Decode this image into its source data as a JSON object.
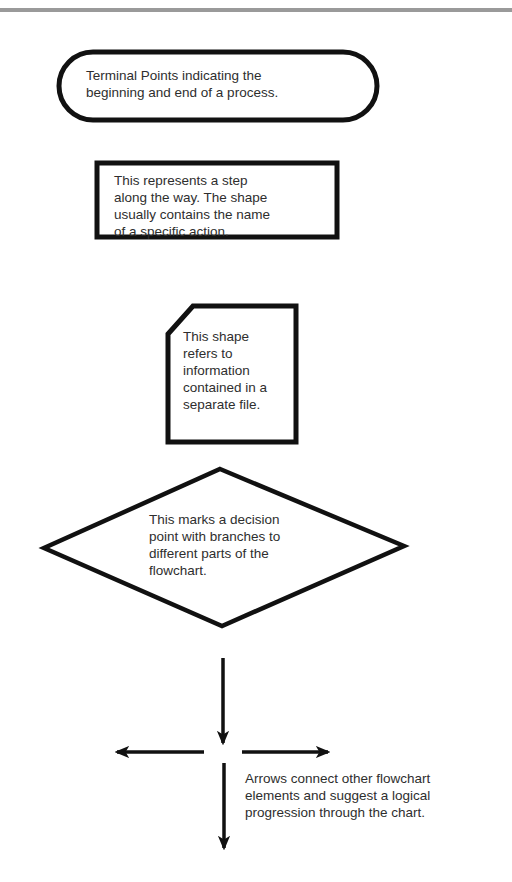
{
  "diagram": {
    "colors": {
      "stroke": "#111111",
      "text": "#2e2e2e",
      "top_rule": "#9a9a9a",
      "background": "#ffffff"
    },
    "shapes": [
      {
        "id": "terminal",
        "shape": "rounded-terminal",
        "text": "Terminal Points indicating the\nbeginning and end of a process."
      },
      {
        "id": "process",
        "shape": "rectangle",
        "text": "This represents a step\nalong the way. The shape\nusually contains the name\nof a specific action."
      },
      {
        "id": "document",
        "shape": "clipped-corner-rectangle",
        "text": "This shape\nrefers to\ninformation\ncontained in a\nseparate file."
      },
      {
        "id": "decision",
        "shape": "diamond",
        "text": "This marks a decision\npoint with branches to\ndifferent parts of the\nflowchart."
      },
      {
        "id": "arrows",
        "shape": "arrows",
        "directions": [
          "down",
          "left",
          "right",
          "down"
        ],
        "text": "Arrows connect other flowchart\nelements and suggest a logical\nprogression through the chart."
      }
    ]
  }
}
